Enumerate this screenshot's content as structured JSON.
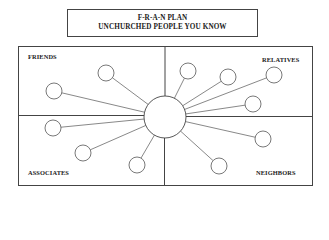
{
  "title": {
    "line1": "F-R-A-N PLAN",
    "line2": "UNCHURCHED PEOPLE YOU KNOW"
  },
  "quadrants": [
    {
      "id": "friends",
      "label": "FRIENDS",
      "position": "top-left"
    },
    {
      "id": "relatives",
      "label": "RELATIVES",
      "position": "top-right"
    },
    {
      "id": "associates",
      "label": "ASSOCIATES",
      "position": "bottom-left"
    },
    {
      "id": "neighbors",
      "label": "NEIGHBORS",
      "position": "bottom-right"
    }
  ],
  "hub": {
    "cx": 165,
    "cy": 117,
    "r": 21
  },
  "nodes": [
    {
      "quadrant": "friends",
      "cx": 54,
      "cy": 91,
      "r": 8
    },
    {
      "quadrant": "friends",
      "cx": 106,
      "cy": 73,
      "r": 8
    },
    {
      "quadrant": "relatives",
      "cx": 188,
      "cy": 71,
      "r": 8
    },
    {
      "quadrant": "relatives",
      "cx": 228,
      "cy": 77,
      "r": 8
    },
    {
      "quadrant": "relatives",
      "cx": 274,
      "cy": 75,
      "r": 8
    },
    {
      "quadrant": "relatives",
      "cx": 253,
      "cy": 104,
      "r": 8
    },
    {
      "quadrant": "associates",
      "cx": 53,
      "cy": 128,
      "r": 8
    },
    {
      "quadrant": "associates",
      "cx": 83,
      "cy": 153,
      "r": 8
    },
    {
      "quadrant": "associates",
      "cx": 137,
      "cy": 165,
      "r": 8
    },
    {
      "quadrant": "neighbors",
      "cx": 263,
      "cy": 139,
      "r": 8
    },
    {
      "quadrant": "neighbors",
      "cx": 219,
      "cy": 166,
      "r": 8
    }
  ],
  "colors": {
    "stroke": "#444444",
    "text": "#222222",
    "background": "#ffffff"
  }
}
